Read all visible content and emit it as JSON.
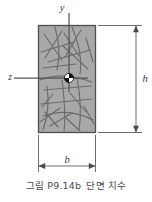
{
  "figure": {
    "caption_figure_number": "그림 P9.14b",
    "caption_description": "단면 치수",
    "axis_labels": {
      "vertical": "y",
      "horizontal": "z"
    },
    "dimension_labels": {
      "height": "h",
      "width": "b"
    },
    "centroid_symbol": "centroid-marker",
    "colors": {
      "section_fill": "#a8a8a8",
      "section_border": "#4f4f4f",
      "crack_lines": "#6b6b6b",
      "axis_lines": "#555555",
      "dimension_lines": "#6e6e6e",
      "caption_text": "#4a4a4a",
      "background": "#ffffff"
    },
    "geometry": {
      "rect_left": 38,
      "rect_top": 25,
      "rect_right": 96,
      "rect_bottom": 133,
      "y_axis_x": 69,
      "z_axis_y": 78,
      "centroid_x": 69,
      "centroid_y": 78
    }
  }
}
